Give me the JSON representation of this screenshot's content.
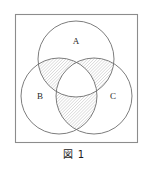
{
  "figure": {
    "caption": "図 1",
    "frame": {
      "x": 15.5,
      "y": 14.5,
      "width": 122,
      "height": 128,
      "stroke_color": "#8c8c8c",
      "stroke_width": 1.1,
      "fill_color": "#ffffff"
    },
    "diagram_type": "venn-3-set",
    "circle_stroke_color": "#6e6e6e",
    "circle_stroke_width": 0.9,
    "circle_fill_color": "#ffffff",
    "hatch": {
      "color": "#9a9a9a",
      "angle_degrees": 45,
      "spacing_px": 2.2,
      "line_width": 0.55
    },
    "sets": [
      {
        "id": "A",
        "label": "A",
        "cx": 76,
        "cy": 59,
        "r": 38,
        "label_x": 76,
        "label_y": 44
      },
      {
        "id": "B",
        "label": "B",
        "cx": 59,
        "cy": 96,
        "r": 38,
        "label_x": 40,
        "label_y": 99
      },
      {
        "id": "C",
        "label": "C",
        "cx": 94,
        "cy": 96,
        "r": 38,
        "label_x": 113,
        "label_y": 99
      }
    ],
    "shaded_regions": [
      {
        "id": "A-and-B-not-C",
        "expression": "A ∩ B \\ C",
        "shaded": true
      },
      {
        "id": "A-and-C-not-B",
        "expression": "A ∩ C \\ B",
        "shaded": true
      },
      {
        "id": "B-and-C-not-A",
        "expression": "B ∩ C \\ A",
        "shaded": true
      },
      {
        "id": "A-and-B-and-C",
        "expression": "A ∩ B ∩ C",
        "shaded": false
      },
      {
        "id": "A-only",
        "expression": "A only",
        "shaded": false
      },
      {
        "id": "B-only",
        "expression": "B only",
        "shaded": false
      },
      {
        "id": "C-only",
        "expression": "C only",
        "shaded": false
      },
      {
        "id": "outside",
        "expression": "outside all sets",
        "shaded": false
      }
    ]
  }
}
